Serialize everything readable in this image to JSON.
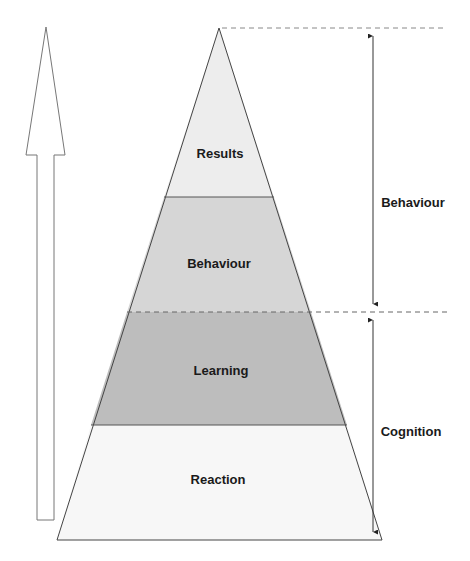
{
  "diagram": {
    "type": "pyramid",
    "levels": [
      {
        "label": "Results",
        "color": "#ededed"
      },
      {
        "label": "Behaviour",
        "color": "#d6d6d6"
      },
      {
        "label": "Learning",
        "color": "#bdbdbd"
      },
      {
        "label": "Reaction",
        "color": "#f7f7f7"
      }
    ],
    "side_groups": [
      {
        "label": "Behaviour",
        "spans": [
          "Results",
          "Behaviour"
        ]
      },
      {
        "label": "Cognition",
        "spans": [
          "Learning",
          "Reaction"
        ]
      }
    ],
    "direction_arrow": "upward"
  }
}
